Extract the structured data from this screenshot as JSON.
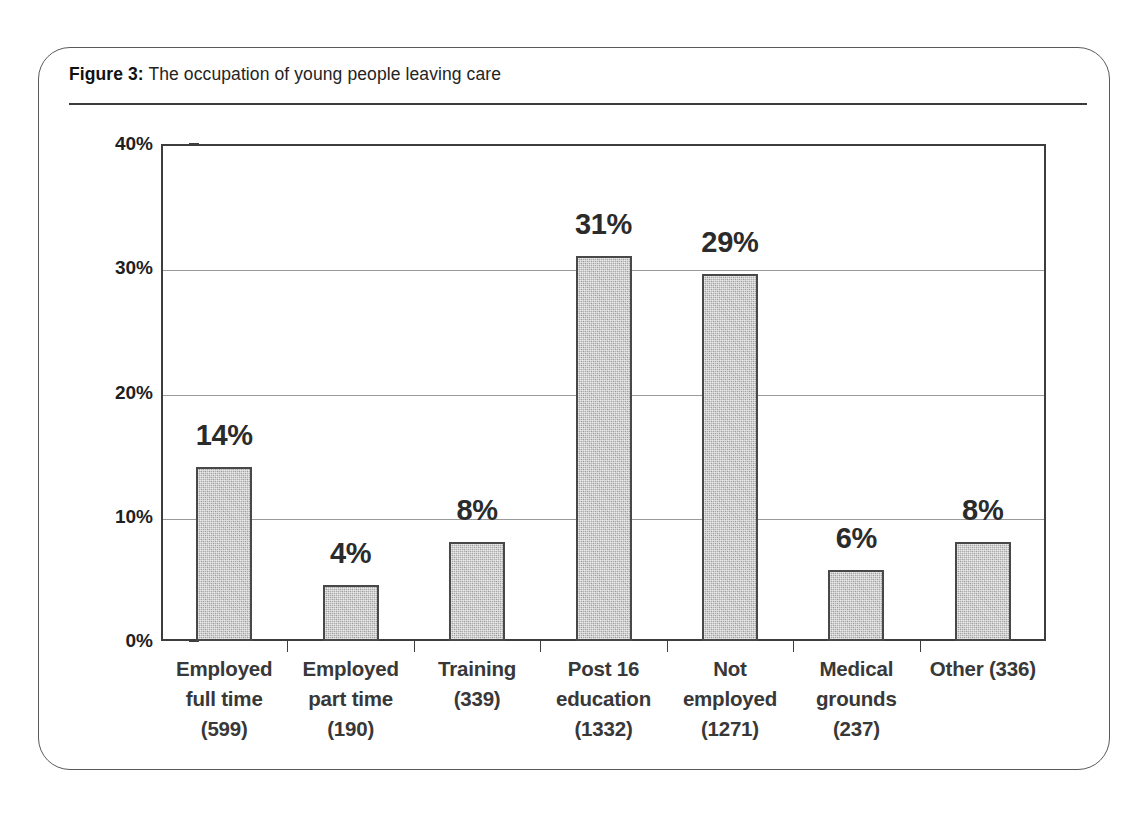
{
  "figure": {
    "label": "Figure 3:",
    "title": "The occupation of young people leaving care"
  },
  "chart_data": {
    "type": "bar",
    "title": "The occupation of young people leaving care",
    "xlabel": "",
    "ylabel": "",
    "ylim": [
      0,
      40
    ],
    "yticks": [
      "0%",
      "10%",
      "20%",
      "30%",
      "40%"
    ],
    "ytick_values": [
      0,
      10,
      20,
      30,
      40
    ],
    "grid": true,
    "legend": "none",
    "units": "percent",
    "categories": [
      "Employed full time (599)",
      "Employed part time (190)",
      "Training (339)",
      "Post 16 education (1332)",
      "Not employed (1271)",
      "Medical grounds (237)",
      "Other (336)"
    ],
    "values": [
      14,
      4.5,
      8,
      31,
      29.5,
      5.7,
      8
    ],
    "data_labels": [
      "14%",
      "4%",
      "8%",
      "31%",
      "29%",
      "6%",
      "8%"
    ],
    "counts": [
      599,
      190,
      339,
      1332,
      1271,
      237,
      336
    ],
    "bar_color": "#aeaeae",
    "bar_border_color": "#484848"
  },
  "axis": {
    "yticks": [
      {
        "label": "40%",
        "value": 40
      },
      {
        "label": "30%",
        "value": 30
      },
      {
        "label": "20%",
        "value": 20
      },
      {
        "label": "10%",
        "value": 10
      },
      {
        "label": "0%",
        "value": 0
      }
    ]
  },
  "categories": [
    {
      "lines": [
        "Employed",
        "full time",
        "(599)"
      ]
    },
    {
      "lines": [
        "Employed",
        "part time",
        "(190)"
      ]
    },
    {
      "lines": [
        "Training",
        "(339)"
      ]
    },
    {
      "lines": [
        "Post 16",
        "education",
        "(1332)"
      ]
    },
    {
      "lines": [
        "Not",
        "employed",
        "(1271)"
      ]
    },
    {
      "lines": [
        "Medical",
        "grounds",
        "(237)"
      ]
    },
    {
      "lines": [
        "Other (336)"
      ]
    }
  ],
  "bars": [
    {
      "label": "14%",
      "value": 14
    },
    {
      "label": "4%",
      "value": 4.5
    },
    {
      "label": "8%",
      "value": 8
    },
    {
      "label": "31%",
      "value": 31
    },
    {
      "label": "29%",
      "value": 29.5
    },
    {
      "label": "6%",
      "value": 5.7
    },
    {
      "label": "8%",
      "value": 8
    }
  ]
}
